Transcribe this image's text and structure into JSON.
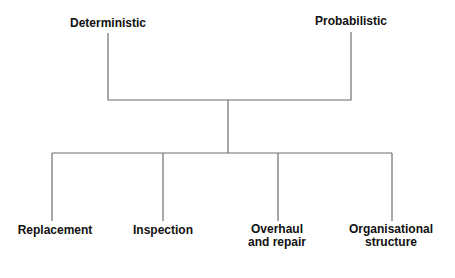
{
  "diagram": {
    "top_nodes": [
      {
        "label": "Deterministic"
      },
      {
        "label": "Probabilistic"
      }
    ],
    "bottom_nodes": [
      {
        "label": "Replacement"
      },
      {
        "label": "Inspection"
      },
      {
        "label": "Overhaul\nand repair",
        "line1": "Overhaul",
        "line2": "and repair"
      },
      {
        "label": "Organisational\nstructure",
        "line1": "Organisational",
        "line2": "structure"
      }
    ],
    "line_color": "#6e6e6e"
  }
}
